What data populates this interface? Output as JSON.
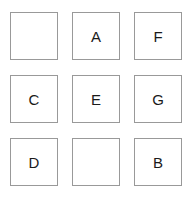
{
  "grid": {
    "rows": 3,
    "columns": 3,
    "border_color": "#999999",
    "background_color": "#ffffff",
    "text_color": "#1a1a1a",
    "cells": [
      {
        "label": "",
        "empty": true
      },
      {
        "label": "A",
        "empty": false
      },
      {
        "label": "F",
        "empty": false
      },
      {
        "label": "C",
        "empty": false
      },
      {
        "label": "E",
        "empty": false
      },
      {
        "label": "G",
        "empty": false
      },
      {
        "label": "D",
        "empty": false
      },
      {
        "label": "",
        "empty": true
      },
      {
        "label": "B",
        "empty": false
      }
    ]
  }
}
